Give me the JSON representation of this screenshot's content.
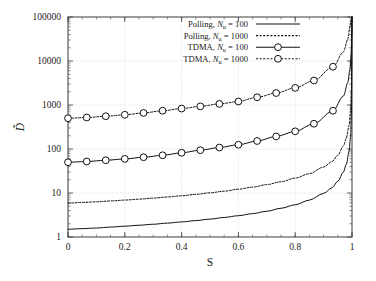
{
  "chart_data": {
    "type": "line",
    "title": "",
    "xlabel": "S",
    "ylabel": "D̃",
    "ylabel_plain": "D-tilde",
    "xlim": [
      0,
      1
    ],
    "ylim": [
      1,
      100000
    ],
    "yscale": "log",
    "xscale": "linear",
    "grid": true,
    "grid_color": "#c8c8c8",
    "axis_color": "#3a3a3a",
    "line_color": "#111111",
    "background": "#ffffff",
    "legend_position": "top-center",
    "xticks": [
      0,
      0.2,
      0.4,
      0.6,
      0.8,
      1
    ],
    "xticklabels": [
      "0",
      "0.2",
      "0.4",
      "0.6",
      "0.8",
      "1"
    ],
    "yticks": [
      1,
      10,
      100,
      1000,
      10000,
      100000
    ],
    "yticklabels": [
      "1",
      "10",
      "100",
      "1000",
      "10000",
      "100000"
    ],
    "series": [
      {
        "name": "Polling, Nu = 100",
        "label_main": "Polling, ",
        "label_var": "N",
        "label_sub": "u",
        "label_tail": " = 100",
        "style": "solid",
        "markers": false,
        "x": [
          0,
          0.05,
          0.1,
          0.15,
          0.2,
          0.25,
          0.3,
          0.35,
          0.4,
          0.45,
          0.5,
          0.55,
          0.6,
          0.65,
          0.7,
          0.75,
          0.8,
          0.85,
          0.9,
          0.93,
          0.95,
          0.97,
          0.98,
          0.99,
          0.995,
          0.998,
          1
        ],
        "y": [
          1.5,
          1.55,
          1.6,
          1.68,
          1.76,
          1.85,
          1.95,
          2.07,
          2.2,
          2.36,
          2.55,
          2.78,
          3.05,
          3.4,
          3.85,
          4.5,
          5.4,
          6.9,
          9.8,
          13.2,
          18.5,
          30,
          45,
          90,
          190,
          600,
          100000
        ]
      },
      {
        "name": "Polling, Nu = 1000",
        "label_main": "Polling, ",
        "label_var": "N",
        "label_sub": "u",
        "label_tail": " = 1000",
        "style": "dotted",
        "markers": false,
        "x": [
          0,
          0.05,
          0.1,
          0.15,
          0.2,
          0.25,
          0.3,
          0.35,
          0.4,
          0.45,
          0.5,
          0.55,
          0.6,
          0.65,
          0.7,
          0.75,
          0.8,
          0.85,
          0.9,
          0.93,
          0.95,
          0.97,
          0.98,
          0.99,
          0.995,
          0.998,
          1
        ],
        "y": [
          5.9,
          6.1,
          6.3,
          6.6,
          6.9,
          7.25,
          7.65,
          8.1,
          8.65,
          9.3,
          10.1,
          11.0,
          12.2,
          13.6,
          15.5,
          18.0,
          21.8,
          27.5,
          39,
          52,
          72,
          118,
          175,
          350,
          740,
          2300,
          100000
        ]
      },
      {
        "name": "TDMA, Nu = 100",
        "label_main": "TDMA, ",
        "label_var": "N",
        "label_sub": "u",
        "label_tail": " = 100",
        "style": "solid",
        "markers": true,
        "marker": "circle",
        "x": [
          0,
          0.066,
          0.133,
          0.2,
          0.266,
          0.333,
          0.4,
          0.466,
          0.533,
          0.6,
          0.666,
          0.733,
          0.8,
          0.866,
          0.933,
          0.97,
          0.985,
          0.993,
          0.997,
          0.999,
          1
        ],
        "y": [
          50,
          52,
          55.5,
          59.5,
          65,
          72,
          82,
          94,
          108,
          125,
          152,
          193,
          252,
          375,
          740,
          1600,
          3200,
          6500,
          15000,
          40000,
          100000
        ]
      },
      {
        "name": "TDMA, Nu = 1000",
        "label_main": "TDMA, ",
        "label_var": "N",
        "label_sub": "u",
        "label_tail": " = 1000",
        "style": "dotted",
        "markers": true,
        "marker": "circle",
        "x": [
          0,
          0.066,
          0.133,
          0.2,
          0.266,
          0.333,
          0.4,
          0.466,
          0.533,
          0.6,
          0.666,
          0.733,
          0.8,
          0.866,
          0.933,
          0.97,
          0.985,
          0.993,
          0.997,
          0.999,
          1
        ],
        "y": [
          500,
          520,
          555,
          600,
          660,
          740,
          830,
          930,
          1060,
          1200,
          1500,
          1870,
          2450,
          3600,
          7400,
          16000,
          31000,
          62000,
          85000,
          97000,
          100000
        ]
      }
    ]
  },
  "legend": {
    "entries": [
      {
        "main": "Polling, ",
        "var": "N",
        "sub": "u",
        "tail": " = 100",
        "style": "solid",
        "marker": false
      },
      {
        "main": "Polling, ",
        "var": "N",
        "sub": "u",
        "tail": " = 1000",
        "style": "dotted",
        "marker": false
      },
      {
        "main": "TDMA, ",
        "var": "N",
        "sub": "u",
        "tail": " = 100",
        "style": "solid",
        "marker": true
      },
      {
        "main": "TDMA, ",
        "var": "N",
        "sub": "u",
        "tail": " = 1000",
        "style": "dotted",
        "marker": true
      }
    ]
  }
}
